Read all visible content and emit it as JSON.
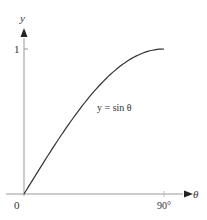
{
  "chart_data": {
    "type": "line",
    "title": "",
    "xlabel": "θ",
    "ylabel": "y",
    "series": [
      {
        "name": "y = sin θ",
        "x": [
          0,
          15,
          30,
          45,
          60,
          75,
          90
        ],
        "values": [
          0,
          0.259,
          0.5,
          0.707,
          0.866,
          0.966,
          1
        ]
      }
    ],
    "x_ticks": [
      "0",
      "90°"
    ],
    "y_ticks": [
      "1"
    ],
    "xlim": [
      0,
      90
    ],
    "ylim": [
      0,
      1
    ],
    "grid": false,
    "annotation": "y = sin θ",
    "colors": {
      "curve": "#333333",
      "axis": "#888888"
    }
  },
  "labels": {
    "y_axis": "y",
    "x_axis": "θ",
    "origin": "0",
    "x_tick_90": "90°",
    "y_tick_1": "1",
    "curve_label": "y = sin θ"
  }
}
